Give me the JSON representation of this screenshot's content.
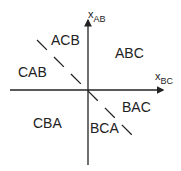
{
  "axes": {
    "vertical": {
      "var": "x",
      "sub": "AB"
    },
    "horizontal": {
      "var": "x",
      "sub": "BC"
    }
  },
  "regions": [
    {
      "label": "ACB"
    },
    {
      "label": "ABC"
    },
    {
      "label": "CAB"
    },
    {
      "label": "BAC"
    },
    {
      "label": "CBA"
    },
    {
      "label": "BCA"
    }
  ],
  "colors": {
    "line": "#222222",
    "background": "#ffffff"
  }
}
